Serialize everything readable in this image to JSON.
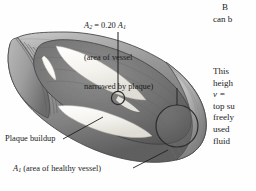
{
  "figure": {
    "name": "blood-vessel-plaque-cutaway",
    "colors": {
      "vessel_outer": "#9b9b9b",
      "vessel_mid": "#8a8a8a",
      "vessel_dark": "#6e6e6e",
      "vessel_shadow": "#5a5a5a",
      "vessel_highlight": "#c3c3c3",
      "plaque": "#f2f1ec",
      "outline": "#3a3a3a",
      "background": "#fefefe",
      "text": "#1b1b1b"
    },
    "callouts": {
      "area_narrowed": {
        "name": "a2-callout",
        "lines": [
          "A2 = 0.20 A1",
          "(area of vessel",
          "narrowed by plaque)"
        ],
        "equation": {
          "symbol": "A",
          "sub": "2",
          "relation": "=",
          "coefficient": "0.20",
          "symbol2": "A",
          "sub2": "1"
        },
        "line2": "(area of vessel",
        "line3": "narrowed by plaque)"
      },
      "plaque_buildup": {
        "name": "plaque-buildup-callout",
        "label": "Plaque buildup"
      },
      "area_healthy": {
        "name": "a1-callout",
        "symbol": "A",
        "sub": "1",
        "label": " (area of healthy vessel)"
      }
    }
  },
  "body_text": {
    "column_top": {
      "line1": "B",
      "line2": "can b"
    },
    "column_middle": {
      "line1": "This ",
      "line2": "heigh",
      "line3": "v = ",
      "line4": "top su",
      "line5": "freely",
      "line6": "used ",
      "line7": "fluid "
    }
  }
}
